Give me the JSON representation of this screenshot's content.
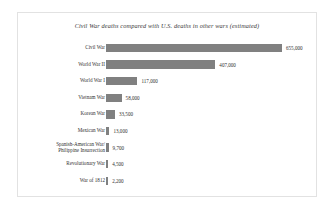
{
  "chart_data": {
    "type": "bar",
    "orientation": "horizontal",
    "title": "Civil War deaths compared with U.S. deaths in other wars (estimated)",
    "xlabel": "",
    "ylabel": "",
    "grid": false,
    "legend": false,
    "xlim": [
      0,
      655000
    ],
    "bar_color": "#808080",
    "categories": [
      "Civil War",
      "World War II",
      "World War I",
      "Vietnam War",
      "Korean War",
      "Mexican War",
      "Spanish-American War/ Philippine Insurrection",
      "Revolutionary War",
      "War of 1812"
    ],
    "values": [
      655000,
      407000,
      117000,
      58000,
      33500,
      13000,
      9700,
      4500,
      2200
    ],
    "value_labels": [
      "655,000",
      "407,000",
      "117,000",
      "58,000",
      "33,500",
      "13,000",
      "9,700",
      "4,500",
      "2,200"
    ]
  },
  "colors": {
    "bar": "#808080",
    "frame": "#e2e2e2",
    "text": "#333333",
    "background": "#ffffff"
  }
}
